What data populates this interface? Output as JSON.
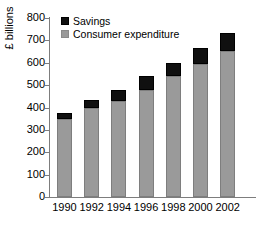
{
  "chart_data": {
    "type": "bar",
    "subtype": "stacked-bar",
    "title": "",
    "xlabel": "",
    "ylabel": "£ billions",
    "ylim": [
      0,
      800
    ],
    "ytick_step": 100,
    "yticks": [
      "800",
      "700",
      "600",
      "500",
      "400",
      "300",
      "200",
      "100",
      "0"
    ],
    "grid": false,
    "legend_position": "top-left-inside",
    "categories": [
      "1990",
      "1992",
      "1994",
      "1996",
      "1998",
      "2000",
      "2002"
    ],
    "series": [
      {
        "name": "Consumer expenditure",
        "color": "#9a9a9a",
        "values": [
          348,
          398,
          430,
          478,
          540,
          595,
          652
        ]
      },
      {
        "name": "Savings",
        "color": "#101010",
        "values": [
          27,
          37,
          48,
          62,
          58,
          70,
          80
        ]
      }
    ],
    "totals": [
      375,
      435,
      478,
      540,
      598,
      665,
      732
    ]
  },
  "legend": {
    "items": [
      {
        "label": "Savings",
        "swatch": "black-square-icon"
      },
      {
        "label": "Consumer expenditure",
        "swatch": "gray-square-icon"
      }
    ]
  },
  "axes": {
    "y_title": "£ billions"
  }
}
